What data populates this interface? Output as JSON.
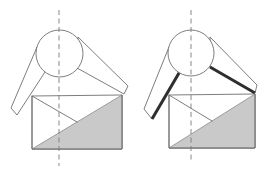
{
  "diagram": {
    "colors": {
      "line": "#6e6e6e",
      "shade": "#c9c9c9",
      "highlight": "#2e2e2e",
      "axis": "#7a7a7a",
      "background": "#ffffff"
    },
    "figures": [
      {
        "id": "left",
        "highlighted_edges": false,
        "axis": {
          "x": 59,
          "y1": 10,
          "y2": 166
        },
        "head": {
          "cx": 59.5,
          "cy": 53.5,
          "r": 23.5
        },
        "left_arm": [
          [
            37,
            47
          ],
          [
            11,
            108
          ],
          [
            17,
            115
          ],
          [
            45,
            72
          ]
        ],
        "right_arm": [
          [
            78,
            37
          ],
          [
            128,
            86
          ],
          [
            124,
            94
          ],
          [
            77,
            68
          ]
        ],
        "rect": {
          "x1": 32,
          "y_top_left": 96,
          "x2": 122,
          "y_bottom": 149
        },
        "shaded_triangle": [
          [
            32,
            149
          ],
          [
            122,
            95
          ],
          [
            122,
            149
          ]
        ],
        "inner_diagonal": [
          [
            32,
            96
          ],
          [
            77,
            122
          ]
        ]
      },
      {
        "id": "right",
        "highlighted_edges": true,
        "axis": {
          "x": 191,
          "y1": 10,
          "y2": 163
        },
        "head": {
          "cx": 191,
          "cy": 53,
          "r": 23
        },
        "left_arm": [
          [
            169,
            47
          ],
          [
            144,
            109
          ],
          [
            152,
            119
          ],
          [
            179,
            73
          ]
        ],
        "right_arm": [
          [
            210,
            37
          ],
          [
            257,
            85
          ],
          [
            255,
            93
          ],
          [
            210,
            67
          ]
        ],
        "rect": {
          "x1": 169,
          "y_top_left": 95,
          "x2": 255,
          "y_bottom": 148
        },
        "shaded_triangle": [
          [
            169,
            148
          ],
          [
            255,
            94
          ],
          [
            255,
            148
          ]
        ],
        "inner_diagonal": [
          [
            169,
            95
          ],
          [
            212,
            121
          ]
        ],
        "thick_edges": [
          [
            [
              179,
              73
            ],
            [
              152,
              119
            ]
          ],
          [
            [
              210,
              67
            ],
            [
              255,
              93
            ]
          ]
        ]
      }
    ]
  }
}
